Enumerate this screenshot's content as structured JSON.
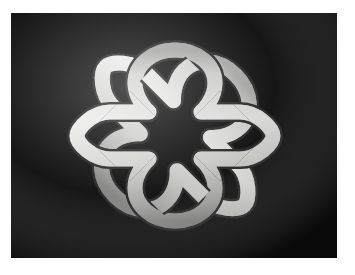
{
  "image": {
    "title": "Celtic knot",
    "subject": "interlaced-quaternary-celtic-knot",
    "medium": "photograph",
    "orientation": "landscape"
  },
  "canvas": {
    "width": 355,
    "height": 275,
    "page_background": "#ffffff"
  },
  "plate": {
    "name": "photo-plate",
    "x": 11,
    "y": 13,
    "width": 326,
    "height": 245,
    "background": "#030303"
  },
  "artwork": {
    "name": "celtic-knot",
    "center_x": 164,
    "center_y": 123,
    "bounds": {
      "x": 68,
      "y": 28,
      "width": 193,
      "height": 191
    },
    "band_width": 15,
    "strand_count": 2,
    "crossings": 8,
    "symmetry": "4-fold rotational",
    "colors": {
      "background": "#030303",
      "highlight": "#f3f3f1",
      "midtone": "#c9c9c6",
      "shadow": "#7e7e7c",
      "edge": "#4a4a48"
    },
    "light_direction": "upper-left"
  },
  "geometry": {
    "note": "Knot drawn as two overlapping rounded square paths rotated 45 degrees relative to each other, producing the woven lattice.",
    "lattice_spacing": 34,
    "corner_loop_radius": 27
  }
}
